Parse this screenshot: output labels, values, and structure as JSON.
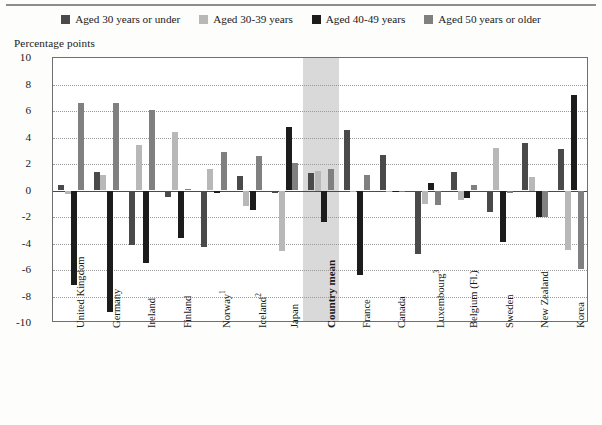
{
  "chart_data": {
    "type": "bar",
    "title": "",
    "subtitle": "",
    "xlabel": "",
    "ylabel": "Percentage points",
    "ylim": [
      -10,
      10
    ],
    "ytick_step": 2,
    "yticks": [
      "10",
      "8",
      "6",
      "4",
      "2",
      "0",
      "-2",
      "-4",
      "-6",
      "-8",
      "-10"
    ],
    "grid": true,
    "legend_position": "top",
    "orientation": "vertical",
    "highlight_category": "Country mean",
    "categories": [
      "United Kingdom",
      "Germany",
      "Ireland",
      "Finland",
      "Norway¹",
      "Iceland²",
      "Japan",
      "Country mean",
      "France",
      "Canada",
      "Luxembourg³",
      "Belgium (Fl.)",
      "Sweden",
      "New Zealand",
      "Korea"
    ],
    "category_notes": [
      "",
      "",
      "",
      "",
      "1",
      "2",
      "",
      "",
      "",
      "",
      "3",
      "",
      "",
      "",
      ""
    ],
    "series": [
      {
        "name": "Aged 30 years or under",
        "color": "#4a4a4a",
        "values": [
          0.4,
          1.4,
          -4.1,
          -0.5,
          -4.3,
          1.1,
          -0.2,
          1.3,
          4.6,
          2.7,
          -4.8,
          1.4,
          -1.6,
          3.6,
          3.1
        ]
      },
      {
        "name": "Aged 30-39 years",
        "color": "#b8b8b8",
        "values": [
          -0.3,
          1.2,
          3.4,
          4.4,
          1.6,
          -1.2,
          -4.6,
          1.5,
          -0.1,
          -0.1,
          -1.0,
          -0.7,
          3.2,
          1.0,
          -4.5
        ]
      },
      {
        "name": "Aged 40-49 years",
        "color": "#1c1c1c",
        "values": [
          -7.1,
          -9.2,
          -5.5,
          -3.6,
          -0.2,
          -1.5,
          4.8,
          -2.4,
          -6.4,
          -0.1,
          0.6,
          -0.6,
          -3.9,
          -2.0,
          7.2
        ]
      },
      {
        "name": "Aged 50 years or older",
        "color": "#808080",
        "values": [
          6.6,
          6.6,
          6.1,
          0.1,
          2.9,
          2.6,
          2.1,
          1.6,
          1.2,
          0.0,
          -1.1,
          0.4,
          -0.2,
          -2.0,
          -5.9
        ]
      }
    ]
  },
  "legend": {
    "items": [
      {
        "label": "Aged 30 years or under",
        "color": "#4a4a4a",
        "swatch": "legend-swatch-aged-30-or-under"
      },
      {
        "label": "Aged 30-39 years",
        "color": "#b8b8b8",
        "swatch": "legend-swatch-aged-30-39"
      },
      {
        "label": "Aged 40-49 years",
        "color": "#1c1c1c",
        "swatch": "legend-swatch-aged-40-49"
      },
      {
        "label": "Aged 50 years or older",
        "color": "#808080",
        "swatch": "legend-swatch-aged-50-or-older"
      }
    ]
  },
  "axis": {
    "y_title": "Percentage points"
  }
}
